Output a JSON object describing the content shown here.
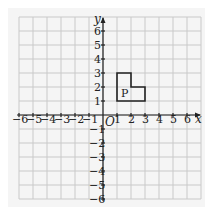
{
  "diagram": {
    "type": "coordinate-grid",
    "x_axis": {
      "label": "x",
      "min": -6,
      "max": 7,
      "tick_labels": [
        "-6",
        "-5",
        "-4",
        "-3",
        "-2",
        "-1",
        "1",
        "2",
        "3",
        "4",
        "5",
        "6"
      ]
    },
    "y_axis": {
      "label": "y",
      "min": -6,
      "max": 7,
      "tick_labels": [
        "6",
        "5",
        "4",
        "3",
        "2",
        "1",
        "-1",
        "-2",
        "-3",
        "-4",
        "-5",
        "-6"
      ]
    },
    "origin_label": "O",
    "shape": {
      "label": "P",
      "vertices": [
        [
          1,
          1
        ],
        [
          1,
          3
        ],
        [
          2,
          3
        ],
        [
          2,
          2
        ],
        [
          3,
          2
        ],
        [
          3,
          1
        ]
      ]
    },
    "colors": {
      "grid": "#c9c9c9",
      "axis": "#222222",
      "panel": "#f5f5f5"
    }
  }
}
